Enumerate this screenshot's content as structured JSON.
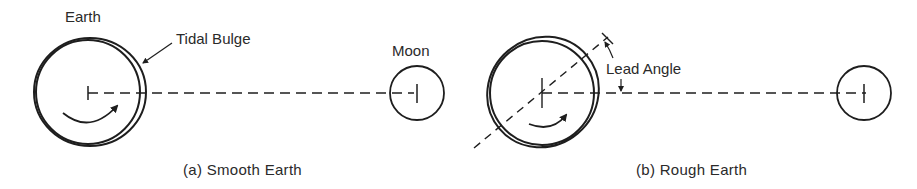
{
  "panels": [
    {
      "id": "a",
      "caption": "(a)  Smooth Earth",
      "labels": {
        "earth": "Earth",
        "tidal_bulge": "Tidal Bulge",
        "moon": "Moon"
      }
    },
    {
      "id": "b",
      "caption": "(b)  Rough Earth",
      "labels": {
        "lead_angle": "Lead Angle"
      }
    }
  ],
  "colors": {
    "ink": "#1e1e1e",
    "background": "#ffffff"
  }
}
